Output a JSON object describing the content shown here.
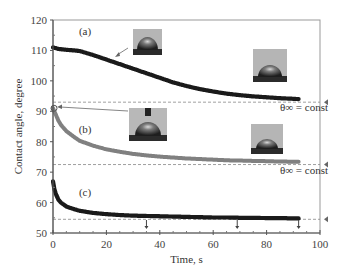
{
  "chart_data": {
    "type": "scatter",
    "title": "",
    "xlabel": "Time, s",
    "ylabel": "Contact angle, degree",
    "xlim": [
      0,
      100
    ],
    "ylim": [
      50,
      120
    ],
    "xticks": [
      0,
      20,
      40,
      60,
      80,
      100
    ],
    "yticks": [
      50,
      60,
      70,
      80,
      90,
      100,
      110,
      120
    ],
    "grid": false,
    "legend": null,
    "series": [
      {
        "name": "(a)",
        "color": "#1a1a1a",
        "x": [
          0,
          2,
          5,
          8,
          10,
          15,
          20,
          25,
          30,
          35,
          40,
          45,
          50,
          55,
          60,
          65,
          70,
          75,
          80,
          85,
          90,
          92
        ],
        "y": [
          111,
          110.5,
          110.2,
          110,
          109.8,
          108.5,
          107,
          105.5,
          104,
          102.5,
          101,
          99.5,
          98.3,
          97.3,
          96.5,
          95.8,
          95.3,
          94.9,
          94.6,
          94.3,
          94.1,
          94
        ]
      },
      {
        "name": "(b)",
        "color": "#6a6a6a",
        "x": [
          0,
          1,
          2,
          3,
          5,
          8,
          10,
          15,
          20,
          25,
          30,
          35,
          40,
          45,
          50,
          55,
          60,
          65,
          70,
          75,
          80,
          85,
          90,
          92
        ],
        "y": [
          91,
          89,
          87,
          85.5,
          83.5,
          81.5,
          80.3,
          78.7,
          77.5,
          76.7,
          76,
          75.5,
          75.1,
          74.8,
          74.5,
          74.3,
          74.1,
          73.9,
          73.8,
          73.7,
          73.6,
          73.5,
          73.4,
          73.4
        ]
      },
      {
        "name": "(c)",
        "color": "#1a1a1a",
        "x": [
          0,
          0.5,
          1,
          2,
          3,
          5,
          8,
          10,
          15,
          20,
          25,
          30,
          35,
          40,
          45,
          50,
          55,
          60,
          65,
          70,
          75,
          80,
          85,
          90,
          92
        ],
        "y": [
          67,
          64.5,
          63,
          61,
          60,
          58.7,
          57.8,
          57.3,
          56.6,
          56.2,
          55.9,
          55.7,
          55.6,
          55.5,
          55.4,
          55.3,
          55.2,
          55.1,
          55.1,
          55,
          55,
          54.9,
          54.9,
          54.8,
          54.8
        ]
      }
    ],
    "reference_lines": [
      {
        "y": 93,
        "style": "dashed",
        "label": "θ∞ = const"
      },
      {
        "y": 72.5,
        "style": "dashed",
        "label": "θ∞ = const"
      },
      {
        "y": 54.5,
        "style": "dashed",
        "label": ""
      }
    ],
    "annotations": [
      {
        "text": "(a)",
        "x": 12,
        "y": 115
      },
      {
        "text": "(b)",
        "x": 12,
        "y": 83
      },
      {
        "text": "(c)",
        "x": 12,
        "y": 62
      },
      {
        "text": "θ∞ = const",
        "x": 85,
        "y": 90
      },
      {
        "text": "θ∞ = const",
        "x": 85,
        "y": 69.5
      }
    ],
    "arrows_down_at_x": [
      35,
      69,
      92
    ],
    "right_markers_y": [
      93,
      72.5,
      54.5
    ],
    "insets": [
      "droplet photo near (a) curve",
      "droplet photo with needle near (b)",
      "droplet photo at end of (a)",
      "droplet photo at end of (b)"
    ]
  }
}
